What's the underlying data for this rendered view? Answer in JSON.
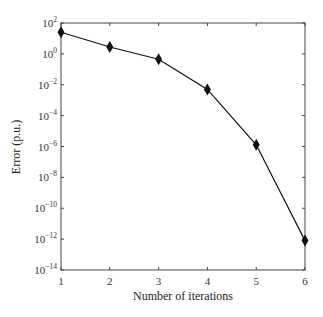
{
  "chart_data": {
    "type": "line",
    "title": "",
    "xlabel": "Number of iterations",
    "ylabel": "Error (p.u.)",
    "yscale": "log",
    "xlim": [
      1,
      6
    ],
    "ylim": [
      1e-14,
      100
    ],
    "x_ticks": [
      1,
      2,
      3,
      4,
      5,
      6
    ],
    "y_ticks": [
      {
        "exp": 2,
        "label": "10",
        "sup": "2"
      },
      {
        "exp": 0,
        "label": "10",
        "sup": "0"
      },
      {
        "exp": -2,
        "label": "10",
        "sup": "−2"
      },
      {
        "exp": -4,
        "label": "10",
        "sup": "−4"
      },
      {
        "exp": -6,
        "label": "10",
        "sup": "−6"
      },
      {
        "exp": -8,
        "label": "10",
        "sup": "−8"
      },
      {
        "exp": -10,
        "label": "10",
        "sup": "−10"
      },
      {
        "exp": -12,
        "label": "10",
        "sup": "−12"
      },
      {
        "exp": -14,
        "label": "10",
        "sup": "−14"
      }
    ],
    "grid": false,
    "legend": null,
    "series": [
      {
        "name": "Error",
        "marker": "diamond",
        "color": "#111111",
        "x": [
          1,
          2,
          3,
          4,
          5,
          6
        ],
        "values": [
          25,
          2.8,
          0.45,
          0.005,
          1.3e-06,
          8e-13
        ]
      }
    ]
  }
}
